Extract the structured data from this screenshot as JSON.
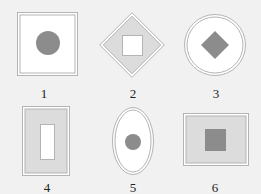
{
  "colors": {
    "background": "#f1f1f1",
    "stroke": "#b4b4b4",
    "light_fill": "#dcdcdc",
    "white_fill": "#ffffff",
    "dark_fill": "#8c8c8c",
    "label": "#222222"
  },
  "figures": [
    {
      "label": "1",
      "label_pos": [
        44,
        94
      ],
      "outer": {
        "shape": "square",
        "x": 17,
        "y": 12,
        "w": 61,
        "h": 64,
        "fill": "white"
      },
      "inner": {
        "shape": "circle",
        "cx": 48,
        "cy": 43,
        "r": 12,
        "fill": "dark"
      }
    },
    {
      "label": "2",
      "label_pos": [
        133,
        94
      ],
      "outer": {
        "shape": "diamond",
        "cx": 132,
        "cy": 45,
        "r": 33,
        "fill": "light"
      },
      "inner": {
        "shape": "square",
        "x": 122,
        "y": 35,
        "w": 21,
        "h": 21,
        "fill": "white"
      }
    },
    {
      "label": "3",
      "label_pos": [
        216,
        94
      ],
      "outer": {
        "shape": "circle",
        "cx": 215,
        "cy": 45,
        "r": 31,
        "fill": "white"
      },
      "inner": {
        "shape": "diamond",
        "cx": 215,
        "cy": 45,
        "r": 14,
        "fill": "dark"
      }
    },
    {
      "label": "4",
      "label_pos": [
        47,
        188
      ],
      "outer": {
        "shape": "rect",
        "x": 22,
        "y": 106,
        "w": 48,
        "h": 70,
        "fill": "light"
      },
      "inner": {
        "shape": "rect",
        "x": 40,
        "y": 124,
        "w": 15,
        "h": 36,
        "fill": "white"
      }
    },
    {
      "label": "5",
      "label_pos": [
        133,
        188
      ],
      "outer": {
        "shape": "ellipse",
        "cx": 133,
        "cy": 141,
        "rx": 21,
        "ry": 34,
        "fill": "white"
      },
      "inner": {
        "shape": "circle",
        "cx": 133,
        "cy": 142,
        "r": 8,
        "fill": "dark"
      }
    },
    {
      "label": "6",
      "label_pos": [
        215,
        188
      ],
      "outer": {
        "shape": "rect",
        "x": 183,
        "y": 113,
        "w": 66,
        "h": 53,
        "fill": "light"
      },
      "inner": {
        "shape": "square",
        "x": 205,
        "y": 129,
        "w": 21,
        "h": 22,
        "fill": "dark"
      }
    }
  ]
}
